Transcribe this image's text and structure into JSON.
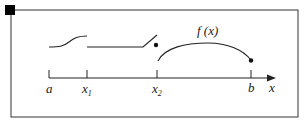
{
  "diagram": {
    "type": "piecewise-function-plot",
    "function_label": "f (x)",
    "axis": {
      "label": "x",
      "ticks": [
        {
          "name": "a",
          "label": "a",
          "sub": ""
        },
        {
          "name": "x1",
          "label": "x",
          "sub": "1"
        },
        {
          "name": "x2",
          "label": "x",
          "sub": "2"
        },
        {
          "name": "b",
          "label": "b",
          "sub": ""
        }
      ]
    },
    "pieces": [
      {
        "interval": "[a, x1)",
        "shape": "s-curve rising"
      },
      {
        "interval": "[x1, x2)",
        "shape": "flat then rising"
      },
      {
        "interval": "x2",
        "shape": "isolated point"
      },
      {
        "interval": "(x2, b]",
        "shape": "arc with closed endpoint at b"
      }
    ],
    "colors": {
      "stroke": "#222222",
      "background": "#ffffff",
      "marker": "#000000"
    }
  }
}
